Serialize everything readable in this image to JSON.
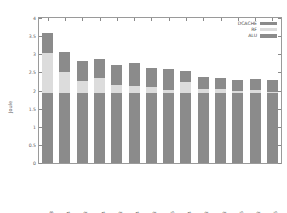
{
  "chart_data": {
    "type": "bar",
    "title": "",
    "xlabel": "",
    "ylabel": "Joule",
    "ylim": [
      0,
      4
    ],
    "ytick_labels": [
      "0",
      "0.5",
      "1",
      "1.5",
      "2",
      "2.5",
      "3",
      "3.5",
      "4"
    ],
    "ytick_values": [
      0,
      0.5,
      1,
      1.5,
      2,
      2.5,
      3,
      3.5,
      4
    ],
    "grid": false,
    "stacked": true,
    "legend_position": "top-right",
    "categories": [
      "C1.W1.R128",
      "C1.W1.R64",
      "C1.W1.R32",
      "C2.W1.R64",
      "C2.W1.R32",
      "C4.W1.R64",
      "C4.W1.R32",
      "C4.W1.R16",
      "C1.W2.R64",
      "C1.W3.R32",
      "C2.W2.R32",
      "C2.W2.R16",
      "C1.W4.R32",
      "C1.W4.R16"
    ],
    "series": [
      {
        "name": "ALU",
        "color": "#8b8b8b",
        "values": [
          1.92,
          1.92,
          1.92,
          1.92,
          1.92,
          1.92,
          1.92,
          1.92,
          1.92,
          1.92,
          1.92,
          1.92,
          1.92,
          1.92
        ]
      },
      {
        "name": "RF",
        "color": "#dcdcdc",
        "values": [
          1.11,
          0.58,
          0.33,
          0.43,
          0.22,
          0.2,
          0.18,
          0.1,
          0.32,
          0.12,
          0.11,
          0.06,
          0.09,
          0.05
        ]
      },
      {
        "name": "DCACHE",
        "color": "#8b8b8b",
        "values": [
          0.57,
          0.56,
          0.57,
          0.53,
          0.56,
          0.64,
          0.53,
          0.56,
          0.31,
          0.34,
          0.32,
          0.31,
          0.32,
          0.32
        ]
      }
    ],
    "totals": [
      3.6,
      3.06,
      2.82,
      2.88,
      2.7,
      2.76,
      2.63,
      2.58,
      2.55,
      2.38,
      2.35,
      2.29,
      2.33,
      2.29
    ]
  },
  "legend": {
    "entries": [
      {
        "label": "DCACHE",
        "key": "dcache"
      },
      {
        "label": "RF",
        "key": "rf"
      },
      {
        "label": "ALU",
        "key": "alu"
      }
    ]
  }
}
